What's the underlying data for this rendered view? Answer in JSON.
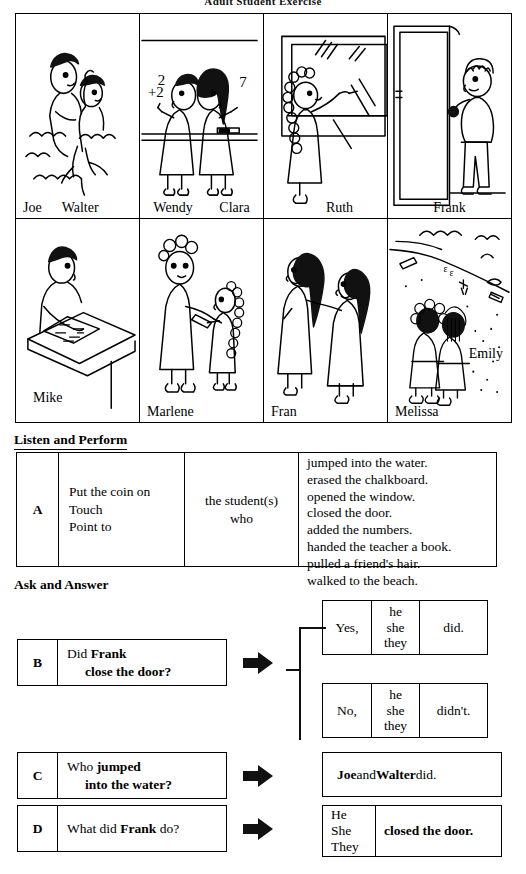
{
  "page": {
    "title": "Adult Student Exercise"
  },
  "illustrations": {
    "rows": [
      {
        "panels": [
          {
            "scene": "students-jumping-into-water",
            "names": [
              "Joe",
              "Walter"
            ],
            "align": "left"
          },
          {
            "scene": "students-adding-numbers-at-chalkboard",
            "names": [
              "Wendy",
              "Clara"
            ],
            "align": "spread"
          },
          {
            "scene": "student-erasing-chalkboard-opening-window",
            "names": [
              "Ruth"
            ],
            "align": "center"
          },
          {
            "scene": "student-closing-the-door",
            "names": [
              "Frank"
            ],
            "align": "center"
          }
        ]
      },
      {
        "panels": [
          {
            "scene": "student-at-desk-with-paper",
            "names": [
              "Mike"
            ],
            "align": "left"
          },
          {
            "scene": "student-handing-teacher-a-book",
            "names": [
              "Marlene"
            ],
            "align": "left"
          },
          {
            "scene": "student-pulling-friends-hair",
            "names": [
              "Fran"
            ],
            "align": "left"
          },
          {
            "scene": "students-walking-to-the-beach",
            "names": [
              "Melissa",
              "Emily"
            ],
            "align": "left"
          }
        ]
      }
    ]
  },
  "listen_and_perform": {
    "heading": "Listen and Perform",
    "table": {
      "letter": "A",
      "verbs": [
        "Put the coin on",
        "Touch",
        "Point to"
      ],
      "who": [
        "the student(s)",
        "who"
      ],
      "actions": [
        "jumped into the water.",
        "erased the chalkboard.",
        "opened the window.",
        "closed the door.",
        "added the numbers.",
        "handed the teacher a book.",
        "pulled a friend's hair.",
        "walked to the beach."
      ]
    }
  },
  "ask_and_answer": {
    "heading": "Ask and Answer",
    "items": [
      {
        "letter": "B",
        "question_line1_plain": "Did ",
        "question_line1_bold": "Frank",
        "question_line2_bold": "close the door?"
      },
      {
        "letter": "C",
        "question_line1_plain": "Who ",
        "question_line1_bold": "jumped",
        "question_line2_bold": "into the water?"
      },
      {
        "letter": "D",
        "question_line1_plain": "What did ",
        "question_line1_bold": "Frank",
        "question_line1_tail": " do?"
      }
    ],
    "answers": {
      "yes": {
        "polarity": "Yes,",
        "pronouns": [
          "he",
          "she",
          "they"
        ],
        "aux": "did."
      },
      "no": {
        "polarity": "No,",
        "pronouns": [
          "he",
          "she",
          "they"
        ],
        "aux": "didn't."
      },
      "c": {
        "name1": "Joe",
        "conj": " and ",
        "name2": "Walter",
        "tail": " did."
      },
      "d": {
        "pronouns": [
          "He",
          "She",
          "They"
        ],
        "predicate": "closed the door."
      }
    }
  }
}
